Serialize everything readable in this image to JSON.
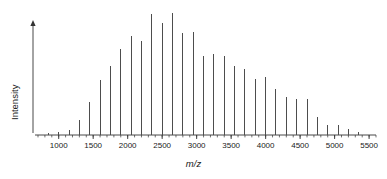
{
  "chart_data": {
    "type": "line",
    "title": "",
    "subtitle": "",
    "xlabel": "m/z",
    "ylabel": "Intensity",
    "xlim": [
      700,
      5600
    ],
    "ylim": [
      0,
      100
    ],
    "grid": false,
    "legend": null,
    "annotations": [],
    "x_tick_labels": [
      "1000",
      "1500",
      "2000",
      "2500",
      "3000",
      "3500",
      "4000",
      "4500",
      "5000",
      "5500"
    ],
    "x_tick_values": [
      1000,
      1500,
      2000,
      2500,
      3000,
      3500,
      4000,
      4500,
      5000,
      5500
    ],
    "x_minor_tick_step": 100,
    "y_tick_labels": [],
    "y_axis_arrow": true,
    "series_style": "stick",
    "peak_spacing": 150,
    "series": [
      {
        "name": "MALDI mass spectrum",
        "color": "#4d4d4d",
        "x": [
          850,
          1000,
          1150,
          1300,
          1450,
          1600,
          1750,
          1900,
          2050,
          2200,
          2350,
          2500,
          2650,
          2800,
          2950,
          3100,
          3250,
          3400,
          3550,
          3700,
          3850,
          4000,
          4150,
          4300,
          4450,
          4600,
          4750,
          4900,
          5050,
          5200,
          5350
        ],
        "values": [
          1.5,
          2.5,
          4.0,
          12.0,
          26.0,
          43.0,
          54.0,
          68.0,
          78.0,
          74.0,
          95.0,
          88.0,
          96.0,
          80.0,
          81.0,
          62.0,
          64.0,
          62.0,
          54.0,
          52.0,
          44.0,
          46.0,
          36.0,
          30.0,
          28.0,
          28.0,
          14.0,
          8.0,
          8.0,
          5.0,
          2.0
        ]
      }
    ]
  },
  "figure": {
    "axis_color": "#333333",
    "peak_color": "#4d4d4d",
    "background": "#ffffff"
  }
}
